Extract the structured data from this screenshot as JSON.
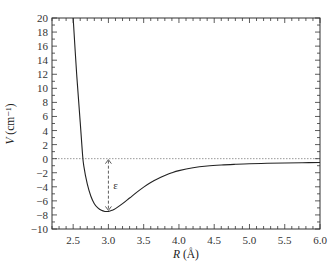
{
  "chart_data": {
    "type": "line",
    "title": "",
    "xlabel": "R (Å)",
    "ylabel": "V (cm⁻¹)",
    "xlim": [
      2.2,
      6.0
    ],
    "ylim": [
      -10,
      20
    ],
    "xticks": [
      2.5,
      3.0,
      3.5,
      4.0,
      4.5,
      5.0,
      5.5,
      6.0
    ],
    "xtick_labels": [
      "2.5",
      "3.0",
      "3.5",
      "4.0",
      "4.5",
      "5.0",
      "5.5",
      "6.0"
    ],
    "xminor_step": 0.1,
    "yticks": [
      -10,
      -8,
      -6,
      -4,
      -2,
      0,
      2,
      4,
      6,
      8,
      10,
      12,
      14,
      16,
      18,
      20
    ],
    "ytick_labels": [
      "−10",
      "−8",
      "−6",
      "−4",
      "−2",
      "0",
      "2",
      "4",
      "6",
      "8",
      "10",
      "12",
      "14",
      "16",
      "18",
      "20"
    ],
    "yminor_step": 1,
    "grid": false,
    "legend": null,
    "series": [
      {
        "name": "V(R)",
        "color": "#222222",
        "x": [
          2.5,
          2.55,
          2.6,
          2.63,
          2.65,
          2.7,
          2.75,
          2.8,
          2.85,
          2.9,
          2.95,
          3.0,
          3.05,
          3.1,
          3.2,
          3.3,
          3.4,
          3.5,
          3.6,
          3.7,
          3.8,
          3.9,
          4.0,
          4.2,
          4.4,
          4.6,
          4.8,
          5.0,
          5.25,
          5.5,
          5.75,
          6.0
        ],
        "values": [
          20.0,
          12.0,
          5.2,
          1.0,
          -1.0,
          -3.6,
          -5.3,
          -6.4,
          -7.0,
          -7.35,
          -7.5,
          -7.5,
          -7.35,
          -7.1,
          -6.4,
          -5.6,
          -4.8,
          -4.05,
          -3.4,
          -2.85,
          -2.4,
          -2.0,
          -1.7,
          -1.3,
          -1.05,
          -0.9,
          -0.8,
          -0.72,
          -0.66,
          -0.62,
          -0.58,
          -0.55
        ]
      }
    ],
    "reference_lines": [
      {
        "type": "horizontal",
        "y": 0,
        "style": "dotted",
        "color": "#999999"
      }
    ],
    "annotations": [
      {
        "type": "double-arrow",
        "x": 3.0,
        "y_from": 0,
        "y_to": -7.5,
        "style": "dashed",
        "label": "ε",
        "label_x": 3.07,
        "label_y": -3.7
      }
    ]
  }
}
